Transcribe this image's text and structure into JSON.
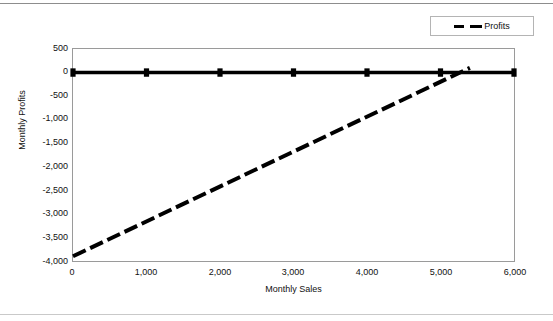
{
  "page": {
    "background": "#ffffff",
    "line_color": "#000000",
    "frame_color": "#9a9a9a"
  },
  "legend": {
    "position": "top-right",
    "entries": [
      {
        "label": "Profits",
        "style": "dashed",
        "color": "#000000"
      }
    ]
  },
  "chart_data": {
    "type": "line",
    "title": "",
    "xlabel": "Monthly Sales",
    "ylabel": "Monthly Profits",
    "xlim": [
      0,
      6000
    ],
    "ylim": [
      -4000,
      500
    ],
    "xticks": [
      0,
      1000,
      2000,
      3000,
      4000,
      5000,
      6000
    ],
    "xtick_labels": [
      "0",
      "1,000",
      "2,000",
      "3,000",
      "4,000",
      "5,000",
      "6,000"
    ],
    "yticks": [
      500,
      0,
      -500,
      -1000,
      -1500,
      -2000,
      -2500,
      -3000,
      -3500,
      -4000
    ],
    "ytick_labels": [
      "500",
      "0",
      "-500",
      "-1,000",
      "-1,500",
      "-2,000",
      "-2,500",
      "-3,000",
      "-3,500",
      "-4,000"
    ],
    "grid": false,
    "legend_position": "top-right",
    "series": [
      {
        "name": "Zero Baseline",
        "style": "solid",
        "marker": "square",
        "color": "#000000",
        "x": [
          0,
          1000,
          2000,
          3000,
          4000,
          5000,
          6000
        ],
        "values": [
          0,
          0,
          0,
          0,
          0,
          0,
          0
        ]
      },
      {
        "name": "Profits",
        "style": "dashed",
        "marker": "none",
        "color": "#000000",
        "x": [
          0,
          5400
        ],
        "values": [
          -3900,
          100
        ]
      }
    ]
  }
}
